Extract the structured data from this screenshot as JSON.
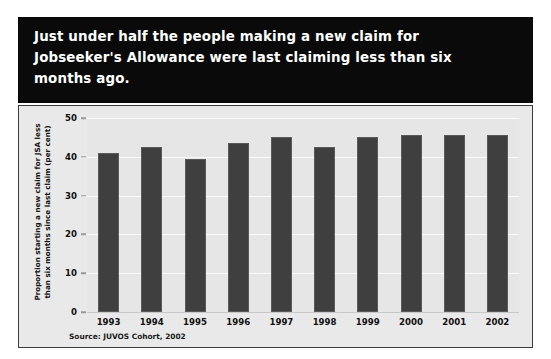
{
  "title": "Just under half the people making a new claim for\nJobseeker's Allowance were last claiming less than six\nmonths ago.",
  "source_note": "Source: JUVOS Cohort, 2002",
  "colors": {
    "title_band_background": "#0a0a0a",
    "title_text": "#ffffff",
    "panel_background": "#e9e9e9",
    "plot_background": "#e6e6e6",
    "bar": "#3f3f3f",
    "gridline": "#fbfbfb",
    "axis_text": "#111111"
  },
  "chart_data": {
    "type": "bar",
    "title": "Just under half the people making a new claim for Jobseeker's Allowance were last claiming less than six months ago.",
    "categories": [
      "1993",
      "1994",
      "1995",
      "1996",
      "1997",
      "1998",
      "1999",
      "2000",
      "2001",
      "2002"
    ],
    "values": [
      41,
      42.5,
      39.5,
      43.5,
      45,
      42.5,
      45,
      45.5,
      45.5,
      45.5
    ],
    "xlabel": "",
    "ylabel": "Proportion starting a new claim for JSA less\nthan six months since last claim (per cent)",
    "ylim": [
      0,
      50
    ],
    "yticks": [
      0,
      10,
      20,
      30,
      40,
      50
    ],
    "ytick_labels": [
      "0",
      "10",
      "20",
      "30",
      "40",
      "50"
    ],
    "grid": true,
    "legend": false,
    "source": "Source: JUVOS Cohort, 2002"
  }
}
